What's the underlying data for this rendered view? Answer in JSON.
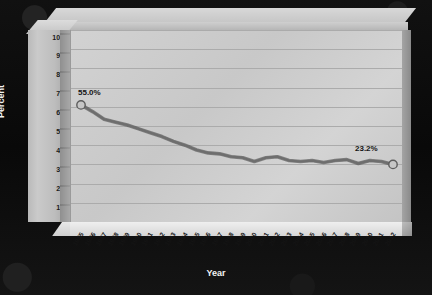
{
  "chart_data": {
    "type": "line",
    "title": "",
    "xlabel": "Year",
    "ylabel": "Percent",
    "ylim": [
      0,
      100
    ],
    "yticks": [
      0,
      10,
      20,
      30,
      40,
      50,
      60,
      70,
      80,
      90,
      100
    ],
    "grid": true,
    "legend": "none",
    "categories": [
      "1985",
      "1986",
      "1987",
      "1988",
      "1989",
      "1990",
      "1991",
      "1992",
      "1993",
      "1994",
      "1995",
      "1996",
      "1997",
      "1998",
      "1999",
      "2000",
      "2001",
      "2002",
      "2003",
      "2004",
      "2005",
      "2006",
      "2007",
      "2008",
      "2009",
      "2010",
      "2011",
      "2012"
    ],
    "values": [
      61.0,
      57.5,
      53.5,
      52.0,
      50.5,
      48.5,
      46.5,
      44.5,
      42.0,
      40.0,
      37.5,
      36.0,
      35.5,
      34.0,
      33.5,
      31.5,
      33.5,
      34.0,
      32.0,
      31.5,
      32.0,
      31.0,
      32.0,
      32.5,
      30.5,
      32.0,
      31.5,
      30.0
    ],
    "annotations": [
      {
        "name": "first-point-label",
        "text": "55.0%",
        "category": "1985"
      },
      {
        "name": "last-point-label",
        "text": "23.2%",
        "category": "2012"
      }
    ],
    "series_color": "#6e6e6e",
    "marker_fill": "#c6c6c6",
    "plot_bg": "#cdcdcd",
    "frame_bg": "#0a0a0a",
    "grid_color": "#ababab",
    "text_color": "#141414",
    "axis_label_color": "#f2f2f2"
  }
}
